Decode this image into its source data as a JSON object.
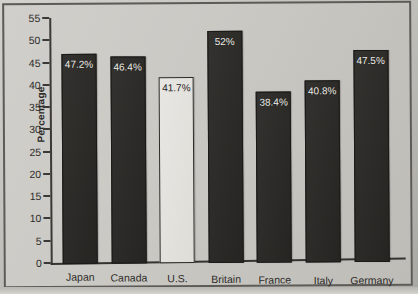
{
  "chart_data": {
    "type": "bar",
    "title": "",
    "xlabel": "",
    "ylabel": "Percentage",
    "ylim": [
      0,
      55
    ],
    "ytick_step": 5,
    "yticks": [
      55,
      50,
      45,
      40,
      35,
      30,
      25,
      20,
      15,
      10,
      5,
      0
    ],
    "ytick_labels": [
      "55",
      "50",
      "45",
      "40",
      "35",
      "30",
      "25",
      "20",
      "15",
      "10",
      "5",
      "0"
    ],
    "grid": false,
    "legend": "none",
    "value_label_position": "inside-top",
    "categories": [
      "Japan",
      "Canada",
      "U.S.",
      "Britain",
      "France",
      "Italy",
      "Germany"
    ],
    "values": [
      47.2,
      46.4,
      41.7,
      52,
      38.4,
      40.8,
      47.5
    ],
    "value_labels": [
      "47.2%",
      "46.4%",
      "41.7%",
      "52%",
      "38.4%",
      "40.8%",
      "47.5%"
    ],
    "highlighted_category": "U.S.",
    "series": [
      {
        "name": "Percentage",
        "values": [
          47.2,
          46.4,
          41.7,
          52,
          38.4,
          40.8,
          47.5
        ]
      }
    ],
    "bars": [
      {
        "category": "Japan",
        "value": 47.2,
        "label": "47.2%",
        "highlight": false
      },
      {
        "category": "Canada",
        "value": 46.4,
        "label": "46.4%",
        "highlight": false
      },
      {
        "category": "U.S.",
        "value": 41.7,
        "label": "41.7%",
        "highlight": true
      },
      {
        "category": "Britain",
        "value": 52,
        "label": "52%",
        "highlight": false
      },
      {
        "category": "France",
        "value": 38.4,
        "label": "38.4%",
        "highlight": false
      },
      {
        "category": "Italy",
        "value": 40.8,
        "label": "40.8%",
        "highlight": false
      },
      {
        "category": "Germany",
        "value": 47.5,
        "label": "47.5%",
        "highlight": false
      }
    ],
    "colors": {
      "bar_fill": "#282724",
      "bar_highlight_fill": "#dbd9d3",
      "bar_outline": "#1b1a18",
      "axis": "#3a3936",
      "text": "#2c2b28",
      "value_text_on_dark": "#f0efe9",
      "value_text_on_light": "#24231f",
      "plot_background": "#c8c6c1",
      "page_background": "#c9c7c2"
    }
  }
}
